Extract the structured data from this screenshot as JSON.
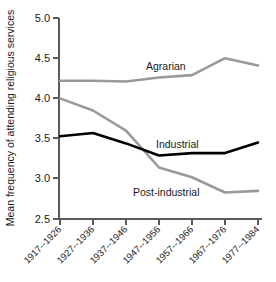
{
  "chart_data": {
    "type": "line",
    "title": "",
    "xlabel": "",
    "ylabel": "Mean frequency of attending religious services",
    "ylim": [
      2.5,
      5.0
    ],
    "yticks": [
      "2.5",
      "3.0",
      "3.5",
      "4.0",
      "4.5",
      "5.0"
    ],
    "ytick_values": [
      2.5,
      3.0,
      3.5,
      4.0,
      4.5,
      5.0
    ],
    "grid": false,
    "legend_position": "inline-labels",
    "categories": [
      "1917--1926",
      "1927--1936",
      "1937--1946",
      "1947--1956",
      "1957--1966",
      "1967--1976",
      "1977--1984"
    ],
    "series": [
      {
        "name": "Agrarian",
        "color": "#9a9a9a",
        "values": [
          4.22,
          4.22,
          4.21,
          4.26,
          4.29,
          4.5,
          4.41
        ]
      },
      {
        "name": "Industrial",
        "color": "#000000",
        "values": [
          3.53,
          3.57,
          3.44,
          3.29,
          3.32,
          3.32,
          3.45
        ]
      },
      {
        "name": "Post-industrial",
        "color": "#9a9a9a",
        "values": [
          4.0,
          3.85,
          3.6,
          3.14,
          3.02,
          2.83,
          2.85
        ]
      }
    ]
  },
  "labels": {
    "agrarian": "Agrarian",
    "industrial": "Industrial",
    "post_industrial": "Post-industrial",
    "y_axis_title": "Mean frequency of attending religious services"
  },
  "colors": {
    "gray_series": "#9a9a9a",
    "black_series": "#000000",
    "axis": "#5a5a5a",
    "background": "#ffffff"
  }
}
